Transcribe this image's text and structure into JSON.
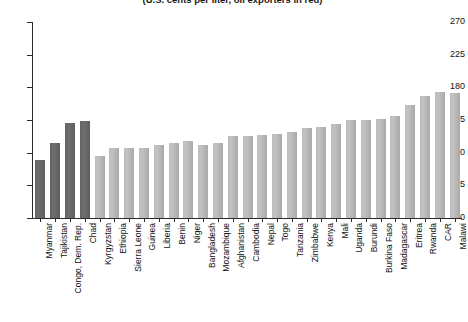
{
  "chart_data": {
    "type": "bar",
    "title": "",
    "subtitle": "(U.S. cents per liter, oil exporters in red)",
    "xlabel": "",
    "ylabel": "",
    "ylim": [
      0,
      270
    ],
    "yticks": [
      0,
      45,
      90,
      135,
      180,
      225,
      270
    ],
    "grid": false,
    "legend": "none",
    "highlight_note": "oil exporters in red",
    "categories": [
      "Myanmar",
      "Tajikistan",
      "Congo, Dem. Rep.",
      "Chad",
      "Kyrgyzstan",
      "Ethiopia",
      "Sierra Leone",
      "Guinea",
      "Liberia",
      "Benin",
      "Niger",
      "Bangladesh",
      "Mozambique",
      "Afghanistan",
      "Cambodia",
      "Nepal",
      "Togo",
      "Tanzania",
      "Zimbabwe",
      "Kenya",
      "Mali",
      "Uganda",
      "Burundi",
      "Burkina Faso",
      "Madagascar",
      "Eritrea",
      "Rwanda",
      "CAR",
      "Malawi"
    ],
    "values": [
      80,
      103,
      131,
      133,
      85,
      96,
      97,
      97,
      101,
      103,
      106,
      101,
      104,
      113,
      113,
      114,
      116,
      119,
      124,
      126,
      130,
      135,
      135,
      136,
      141,
      155,
      168,
      173,
      172
    ],
    "highlighted": [
      true,
      true,
      true,
      true,
      false,
      false,
      false,
      false,
      false,
      false,
      false,
      false,
      false,
      false,
      false,
      false,
      false,
      false,
      false,
      false,
      false,
      false,
      false,
      false,
      false,
      false,
      false,
      false,
      false
    ],
    "colors": {
      "highlight": "#666666",
      "normal": "#b8b8b8",
      "axis": "#2b2b2b"
    }
  }
}
